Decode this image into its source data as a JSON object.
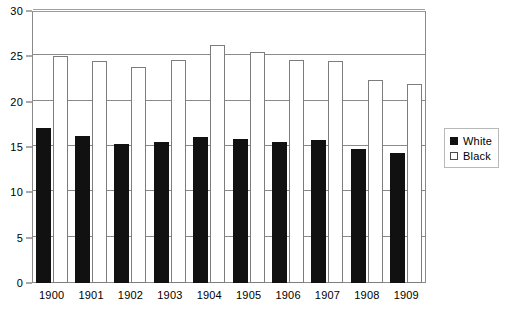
{
  "chart_data": {
    "type": "bar",
    "title": "",
    "subtitle": "",
    "xlabel": "",
    "ylabel": "",
    "categories": [
      "1900",
      "1901",
      "1902",
      "1903",
      "1904",
      "1905",
      "1906",
      "1907",
      "1908",
      "1909"
    ],
    "series": [
      {
        "name": "White",
        "color": "#111111",
        "style": "solid-black-fill",
        "values": [
          17.1,
          16.2,
          15.3,
          15.5,
          16.1,
          15.9,
          15.6,
          15.8,
          14.8,
          14.3
        ]
      },
      {
        "name": "Black",
        "color": "#ffffff",
        "style": "white-fill-outlined",
        "values": [
          25.0,
          24.5,
          23.8,
          24.6,
          26.2,
          25.5,
          24.6,
          24.5,
          22.4,
          21.9
        ]
      }
    ],
    "ylim": [
      0,
      30
    ],
    "yticks": [
      0,
      5,
      10,
      15,
      20,
      25,
      30
    ],
    "ytick_labels": [
      "0",
      "5",
      "10",
      "15",
      "20",
      "25",
      "30"
    ],
    "grid": true,
    "grid_axis": "y",
    "legend_position": "right",
    "legend_entries": [
      "White",
      "Black"
    ]
  },
  "legend": {
    "items": [
      {
        "label": "White",
        "swatch": "filled-square-icon"
      },
      {
        "label": "Black",
        "swatch": "hollow-square-icon"
      }
    ]
  }
}
